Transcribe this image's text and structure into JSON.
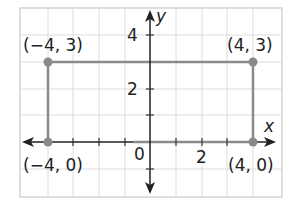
{
  "figure": {
    "type": "coordinate-plane",
    "axes": {
      "x_label": "x",
      "y_label": "y",
      "origin_label": "0"
    },
    "x_tick_labels": [
      "2"
    ],
    "y_tick_labels": [
      "4",
      "2"
    ],
    "x_range": [
      -5,
      5
    ],
    "y_range": [
      -2,
      5
    ],
    "rectangle_color": "#8a8a8a",
    "points": [
      {
        "label": "(−4, 3)",
        "x": -4,
        "y": 3
      },
      {
        "label": "(4, 3)",
        "x": 4,
        "y": 3
      },
      {
        "label": "(−4, 0)",
        "x": -4,
        "y": 0
      },
      {
        "label": "(4, 0)",
        "x": 4,
        "y": 0
      }
    ]
  }
}
